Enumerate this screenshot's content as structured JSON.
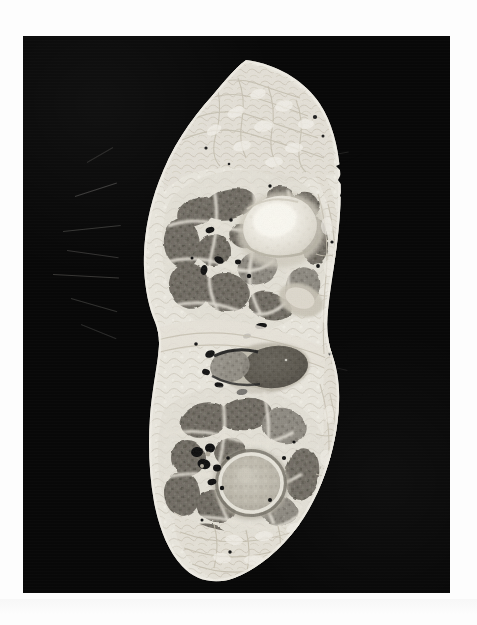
{
  "page": {
    "background_color": "#fdfdfd",
    "width": 477,
    "height": 625,
    "caption": ""
  },
  "plate": {
    "label": "anatomical cross-section photograph",
    "background_color": "#080808",
    "x": 23,
    "y": 36,
    "width": 427,
    "height": 557
  },
  "specimen": {
    "label": "gross anatomy transverse section of a limb",
    "modality": "photograph of cryosection / plastinated slice",
    "color_mode": "grayscale",
    "orientation": "vertical, specimen occupies left-of-centre of plate",
    "tissue_colors": {
      "subcutaneous_fat": "#e8e5dc",
      "fascia_connective": "#d9d5c9",
      "muscle_dark": "#6a675f",
      "muscle_mid": "#8b877d",
      "bone_bright": "#f6f4ec",
      "bone_marrow": "#bdb9ad",
      "vessel_black": "#141414",
      "background_black": "#080808"
    },
    "structures": [
      {
        "name": "subcutaneous-adipose-rim",
        "region": "entire periphery",
        "appearance": "pale reticulated fat with lobules"
      },
      {
        "name": "superior-bone",
        "region": "upper third, right of centre",
        "appearance": "bright cancellous bone with cortical ring"
      },
      {
        "name": "superior-muscle-group",
        "region": "upper third, left",
        "appearance": "dark muscle bellies separated by pale septa"
      },
      {
        "name": "central-dark-oval",
        "region": "mid height, right of centre",
        "appearance": "dark oval muscle / tendon mass"
      },
      {
        "name": "inferior-bone",
        "region": "lower third, centre",
        "appearance": "rounded bone with mottled marrow"
      },
      {
        "name": "inferior-muscle-group",
        "region": "lower third, left",
        "appearance": "clustered dark muscle bundles"
      },
      {
        "name": "neurovascular-foramina",
        "region": "scattered",
        "appearance": "small black vessel lumina"
      },
      {
        "name": "torn-lateral-margin",
        "region": "right edge",
        "appearance": "irregular jagged cut margin"
      },
      {
        "name": "stray-hair-fibres",
        "region": "left margin",
        "appearance": "fine pale filaments over black field"
      }
    ]
  }
}
